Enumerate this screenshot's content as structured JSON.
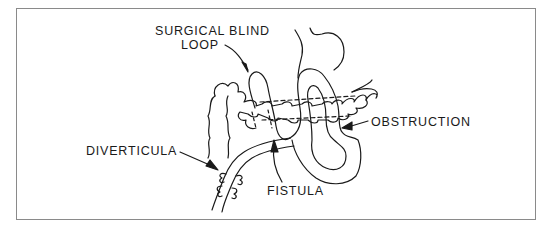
{
  "figure": {
    "type": "anatomical-line-diagram",
    "labels": {
      "surgical_blind_loop_line1": "SURGICAL BLIND",
      "surgical_blind_loop_line2": "LOOP",
      "obstruction": "OBSTRUCTION",
      "diverticula": "DIVERTICULA",
      "fistula": "FISTULA"
    },
    "structures": [
      {
        "name": "stomach",
        "position": "top-center"
      },
      {
        "name": "transverse-colon",
        "position": "center band with haustra"
      },
      {
        "name": "surgical-blind-loop",
        "position": "center-left loop"
      },
      {
        "name": "small-bowel-loop",
        "position": "center-right loop"
      },
      {
        "name": "duodenum-jejunum-with-diverticula",
        "position": "lower-left"
      }
    ],
    "colors": {
      "line": "#1a1a1a",
      "frame": "#8a8a8a",
      "background": "#ffffff"
    }
  }
}
